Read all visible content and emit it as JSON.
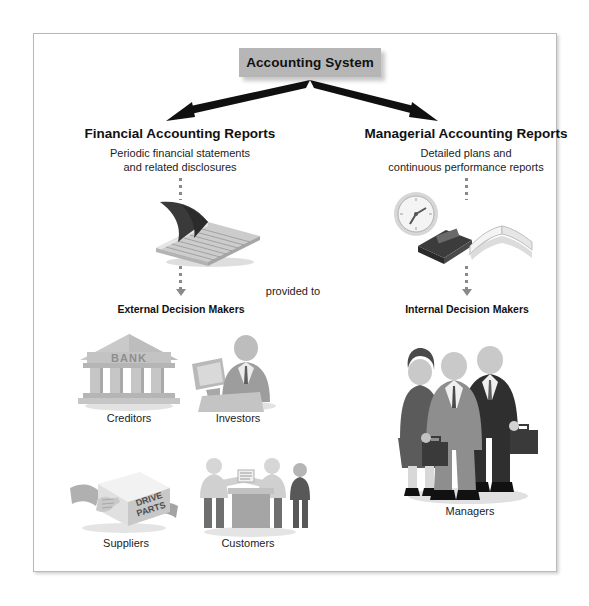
{
  "diagram": {
    "title": "Accounting System",
    "branches": [
      {
        "heading": "Financial Accounting Reports",
        "subtitle_line1": "Periodic financial statements",
        "subtitle_line2": "and related disclosures",
        "icon": "ledger-book-icon",
        "audience": "External Decision Makers",
        "users": [
          {
            "label": "Creditors",
            "icon": "bank-building-icon",
            "sign_text": "BANK"
          },
          {
            "label": "Investors",
            "icon": "businessman-with-monitor-icon"
          },
          {
            "label": "Suppliers",
            "icon": "hands-holding-box-icon",
            "box_text_line1": "DRIVE",
            "box_text_line2": "PARTS"
          },
          {
            "label": "Customers",
            "icon": "customers-at-counter-icon"
          }
        ]
      },
      {
        "heading": "Managerial Accounting Reports",
        "subtitle_line1": "Detailed plans and",
        "subtitle_line2": "continuous performance reports",
        "icon": "clock-and-books-icon",
        "audience": "Internal Decision Makers",
        "users": [
          {
            "label": "Managers",
            "icon": "three-business-people-icon"
          }
        ]
      }
    ],
    "connector_label": "provided to",
    "colors": {
      "title_box_fill": "#b6b6b6",
      "arrow": "#101010",
      "dotted_connector": "#8a8a8a",
      "frame_border": "#b9b9b9",
      "text": "#111111",
      "art_mid_gray": "#9a9a9a",
      "art_light_gray": "#cfcfcf",
      "art_dark_gray": "#5a5a5a",
      "art_near_black": "#2f2f2f"
    }
  }
}
